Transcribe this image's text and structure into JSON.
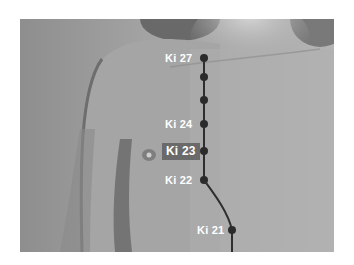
{
  "figure": {
    "line_color": "#2e2e2e",
    "dot_color": "#2b2b2b",
    "label_color": "#ffffff",
    "highlight_bg": "#6a6a6a"
  },
  "points": [
    {
      "id": "ki27",
      "label": "Ki 27",
      "x": 204,
      "y": 58,
      "labeled": true,
      "highlighted": false
    },
    {
      "id": "ki26",
      "label": "",
      "x": 204,
      "y": 77,
      "labeled": false,
      "highlighted": false
    },
    {
      "id": "ki25",
      "label": "",
      "x": 204,
      "y": 100,
      "labeled": false,
      "highlighted": false
    },
    {
      "id": "ki24",
      "label": "Ki 24",
      "x": 204,
      "y": 124,
      "labeled": true,
      "highlighted": false
    },
    {
      "id": "ki23",
      "label": "Ki 23",
      "x": 204,
      "y": 151,
      "labeled": true,
      "highlighted": true
    },
    {
      "id": "ki22",
      "label": "Ki 22",
      "x": 204,
      "y": 180,
      "labeled": true,
      "highlighted": false
    },
    {
      "id": "ki21",
      "label": "Ki 21",
      "x": 232,
      "y": 230,
      "labeled": true,
      "highlighted": false
    }
  ],
  "labels": {
    "ki27": "Ki 27",
    "ki24": "Ki 24",
    "ki23": "Ki 23",
    "ki22": "Ki 22",
    "ki21": "Ki 21"
  }
}
